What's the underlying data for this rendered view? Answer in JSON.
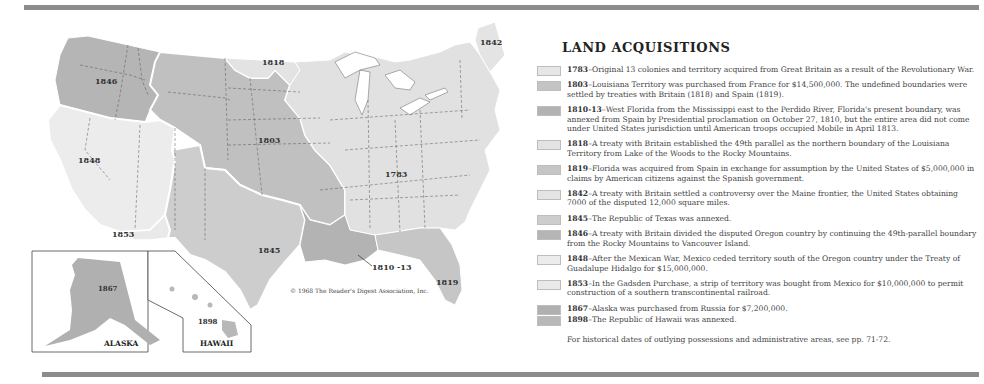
{
  "page": {
    "title": "LAND ACQUISITIONS",
    "copyright": "© 1968 The Reader's Digest Association, Inc.",
    "footnote": "For historical dates of outlying possessions and administrative areas, see pp. 71-72."
  },
  "colors": {
    "lightest": "#e8e8e8",
    "light": "#dadada",
    "medium": "#bdbdbd",
    "dark": "#a9a9a9",
    "rule": "#8c8c8c",
    "border": "#ffffff"
  },
  "map": {
    "region_labels": {
      "r1846": "1846",
      "r1818": "1818",
      "r1842": "1842",
      "r1803": "1803",
      "r1848": "1848",
      "r1783": "1783",
      "r1853": "1853",
      "r1845": "1845",
      "r1810": "1810 -13",
      "r1819": "1819",
      "r1867": "1867",
      "r1898": "1898"
    },
    "insets": {
      "alaska_label": "ALASKA",
      "hawaii_label": "HAWAII"
    }
  },
  "legend": {
    "entries": [
      {
        "year": "1783",
        "swatch": "#e6e6e6",
        "text": "Original 13 colonies and territory acquired from Great Britain as a result of the Revolutionary War."
      },
      {
        "year": "1803",
        "swatch": "#c4c4c4",
        "text": "Louisiana Territory was purchased from France for $14,500,000. The undefined boundaries were settled by treaties with Britain (1818) and Spain (1819)."
      },
      {
        "year": "1810-13",
        "swatch": "#b3b3b3",
        "text": "West Florida from the Mississippi east to the Perdido River, Florida's present boundary, was annexed from Spain by Presidential proclamation on October 27, 1810, but the entire area did not come under United States jurisdiction until American troops occupied Mobile in April 1813."
      },
      {
        "year": "1818",
        "swatch": "#e3e3e3",
        "text": "A treaty with Britain established the 49th parallel as the northern boundary of the Louisiana Territory from Lake of the Woods to the Rocky Mountains."
      },
      {
        "year": "1819",
        "swatch": "#c6c6c6",
        "text": "Florida was acquired from Spain in exchange for assumption by the United States of $5,000,000 in claims by American citizens against the Spanish government."
      },
      {
        "year": "1842",
        "swatch": "#e4e4e4",
        "text": "A treaty with Britain settled a controversy over the Maine frontier, the United States obtaining 7000 of the disputed 12,000 square miles."
      },
      {
        "year": "1845",
        "swatch": "#cdcdcd",
        "text": "The Republic of Texas was annexed."
      },
      {
        "year": "1846",
        "swatch": "#b5b5b5",
        "text": "A treaty with Britain divided the disputed Oregon country by continuing the 49th-parallel boundary from the Rocky Mountains to Vancouver Island."
      },
      {
        "year": "1848",
        "swatch": "#ececec",
        "text": "After the Mexican War, Mexico ceded territory south of the Oregon country under the Treaty of Guadalupe Hidalgo for $15,000,000."
      },
      {
        "year": "1853",
        "swatch": "#e9e9e9",
        "text": "In the Gadsden Purchase, a strip of territory was bought from Mexico for $10,000,000 to permit construction of a southern transcontinental railroad."
      },
      {
        "year": "1867",
        "swatch": "#b0b0b0",
        "text": "Alaska was purchased from Russia for $7,200,000."
      },
      {
        "year": "1898",
        "swatch": "#b8b8b8",
        "text": "The Republic of Hawaii was annexed."
      }
    ]
  }
}
